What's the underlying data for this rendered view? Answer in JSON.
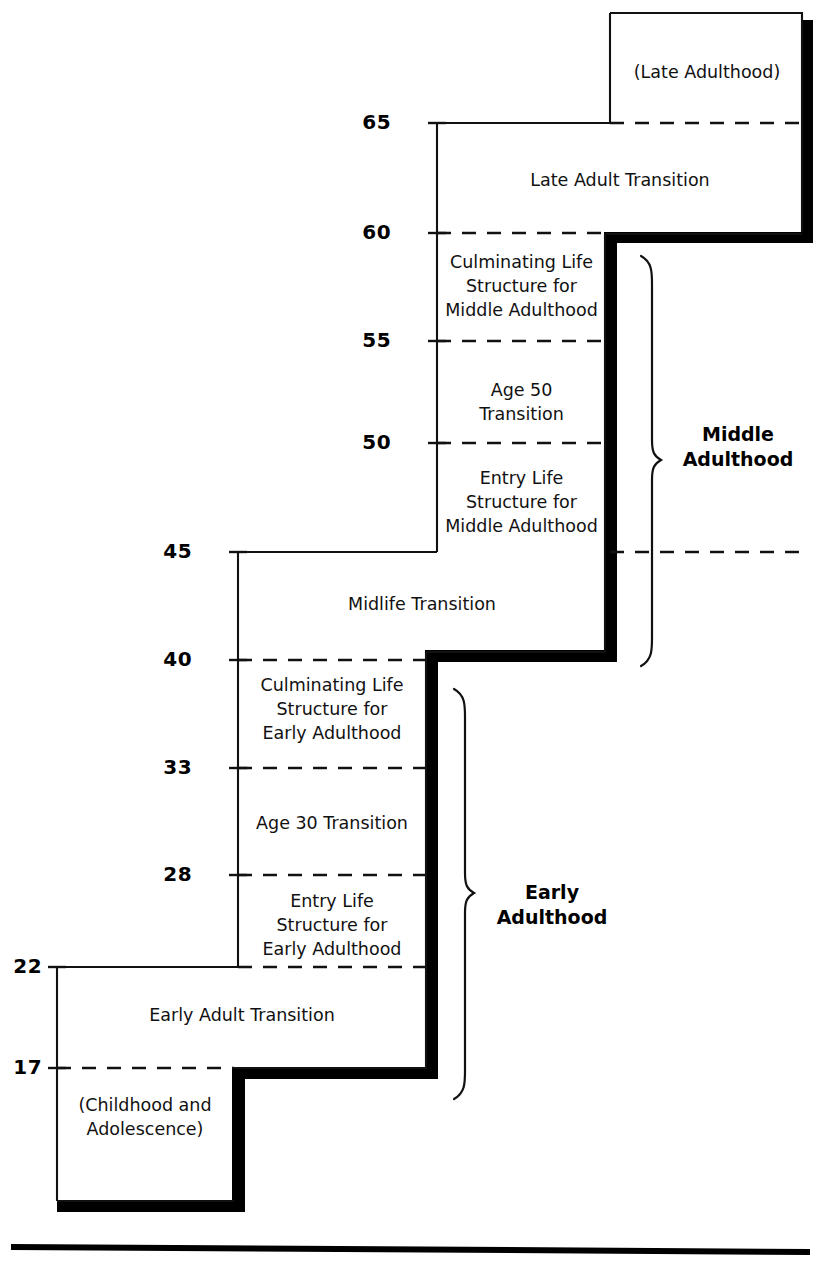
{
  "diagram": {
    "axis_ticks": [
      {
        "id": "t65",
        "value": "65",
        "x": 391,
        "y": 110
      },
      {
        "id": "t60",
        "value": "60",
        "x": 391,
        "y": 222
      },
      {
        "id": "t55",
        "value": "55",
        "x": 391,
        "y": 330
      },
      {
        "id": "t50",
        "value": "50",
        "x": 391,
        "y": 432
      },
      {
        "id": "t45",
        "value": "45",
        "x": 192,
        "y": 540
      },
      {
        "id": "t40",
        "value": "40",
        "x": 192,
        "y": 648
      },
      {
        "id": "t33",
        "value": "33",
        "x": 192,
        "y": 757
      },
      {
        "id": "t28",
        "value": "28",
        "x": 192,
        "y": 864
      },
      {
        "id": "t22",
        "value": "22",
        "x": 10,
        "y": 973
      },
      {
        "id": "t17",
        "value": "17",
        "x": 10,
        "y": 1050
      }
    ],
    "periods": [
      {
        "id": "late-adulthood",
        "label": "(Late Adulthood)",
        "x": 612,
        "y": 60,
        "w": 190
      },
      {
        "id": "late-adult-transition",
        "label": "Late Adult Transition",
        "x": 438,
        "y": 168,
        "w": 364
      },
      {
        "id": "culminating-middle",
        "label": "Culminating Life\nStructure for\nMiddle Adulthood",
        "x": 438,
        "y": 250,
        "w": 167
      },
      {
        "id": "age-50-transition",
        "label": "Age 50\nTransition",
        "x": 438,
        "y": 378,
        "w": 167
      },
      {
        "id": "entry-middle",
        "label": "Entry Life\nStructure for\nMiddle Adulthood",
        "x": 438,
        "y": 466,
        "w": 167
      },
      {
        "id": "midlife-transition",
        "label": "Midlife Transition",
        "x": 238,
        "y": 592,
        "w": 368
      },
      {
        "id": "culminating-early",
        "label": "Culminating Life\nStructure for\nEarly Adulthood",
        "x": 238,
        "y": 673,
        "w": 188
      },
      {
        "id": "age-30-transition",
        "label": "Age 30 Transition",
        "x": 238,
        "y": 811,
        "w": 188
      },
      {
        "id": "entry-early",
        "label": "Entry Life\nStructure for\nEarly Adulthood",
        "x": 238,
        "y": 889,
        "w": 188
      },
      {
        "id": "early-adult-transition",
        "label": "Early Adult Transition",
        "x": 57,
        "y": 1003,
        "w": 370
      },
      {
        "id": "childhood",
        "label": "(Childhood and\nAdolescence)",
        "x": 57,
        "y": 1093,
        "w": 176
      }
    ],
    "eras": [
      {
        "id": "middle-adulthood",
        "label": "Middle\nAdulthood",
        "x": 668,
        "y": 422,
        "w": 140
      },
      {
        "id": "early-adulthood",
        "label": "Early\nAdulthood",
        "x": 482,
        "y": 880,
        "w": 140
      }
    ],
    "colors": {
      "ink": "#000000",
      "thin_line": "#1a1a1a",
      "shadow": "#000000",
      "background": "#ffffff"
    },
    "geometry_note": "stair-step outline with heavy drop shadow on right and bottom edges"
  }
}
